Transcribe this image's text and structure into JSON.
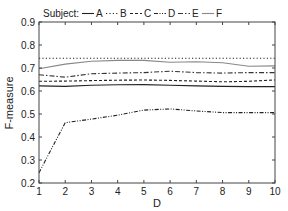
{
  "chart_data": {
    "type": "line",
    "title": "",
    "xlabel": "D",
    "ylabel": "F-measure",
    "x": [
      1,
      2,
      3,
      4,
      5,
      6,
      7,
      8,
      9,
      10
    ],
    "xlim": [
      1,
      10
    ],
    "ylim": [
      0.2,
      0.9
    ],
    "xticks": [
      "1",
      "2",
      "3",
      "4",
      "5",
      "6",
      "7",
      "8",
      "9",
      "10"
    ],
    "yticks": [
      "0.2",
      "0.3",
      "0.4",
      "0.5",
      "0.6",
      "0.7",
      "0.8",
      "0.9"
    ],
    "grid": false,
    "legend": {
      "title": "Subject:",
      "position": "top",
      "entries": [
        "A",
        "B",
        "C",
        "D",
        "E",
        "F"
      ]
    },
    "series": [
      {
        "name": "A",
        "style": "solid",
        "color": "#222222",
        "values": [
          0.622,
          0.62,
          0.625,
          0.627,
          0.628,
          0.625,
          0.622,
          0.62,
          0.619,
          0.619
        ]
      },
      {
        "name": "B",
        "style": "dotted",
        "color": "#222222",
        "values": [
          0.742,
          0.742,
          0.742,
          0.742,
          0.742,
          0.742,
          0.742,
          0.742,
          0.742,
          0.742
        ]
      },
      {
        "name": "C",
        "style": "dashed",
        "color": "#222222",
        "values": [
          0.642,
          0.643,
          0.645,
          0.647,
          0.648,
          0.646,
          0.643,
          0.64,
          0.642,
          0.648
        ]
      },
      {
        "name": "D",
        "style": "dash-dot-dot",
        "color": "#222222",
        "values": [
          0.245,
          0.462,
          0.478,
          0.495,
          0.517,
          0.522,
          0.513,
          0.506,
          0.506,
          0.506
        ]
      },
      {
        "name": "E",
        "style": "dash-dot",
        "color": "#333333",
        "values": [
          0.671,
          0.66,
          0.675,
          0.678,
          0.68,
          0.686,
          0.68,
          0.678,
          0.68,
          0.68
        ]
      },
      {
        "name": "F",
        "style": "solid",
        "color": "#888888",
        "values": [
          0.697,
          0.717,
          0.729,
          0.733,
          0.733,
          0.725,
          0.727,
          0.723,
          0.708,
          0.709
        ]
      }
    ]
  }
}
